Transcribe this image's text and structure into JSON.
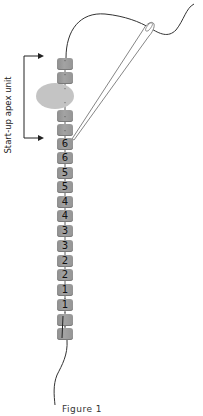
{
  "figure": {
    "caption": "Figure 1",
    "bracket_label": "Start-up apex unit",
    "top_beads": [
      {
        "label": "",
        "top": 58
      },
      {
        "label": "",
        "top": 72
      }
    ],
    "accent_bead": {
      "shape": "oval",
      "color": "#c4c4c4"
    },
    "apex_beads": [
      {
        "label": "",
        "top": 110
      },
      {
        "label": "",
        "top": 124
      }
    ],
    "numbered_beads": [
      {
        "label": "6",
        "top": 138
      },
      {
        "label": "6",
        "top": 152
      },
      {
        "label": "5",
        "top": 167
      },
      {
        "label": "5",
        "top": 181
      },
      {
        "label": "4",
        "top": 196
      },
      {
        "label": "4",
        "top": 210
      },
      {
        "label": "3",
        "top": 225
      },
      {
        "label": "3",
        "top": 240
      },
      {
        "label": "2",
        "top": 255
      },
      {
        "label": "2",
        "top": 269
      },
      {
        "label": "1",
        "top": 284
      },
      {
        "label": "1",
        "top": 299
      }
    ],
    "base_beads": [
      {
        "label": "",
        "top": 314
      },
      {
        "label": "",
        "top": 328
      }
    ],
    "colors": {
      "bead": "#9a9a9a",
      "oval": "#c4c4c4",
      "thread": "#333333",
      "needle": "#777777"
    }
  }
}
